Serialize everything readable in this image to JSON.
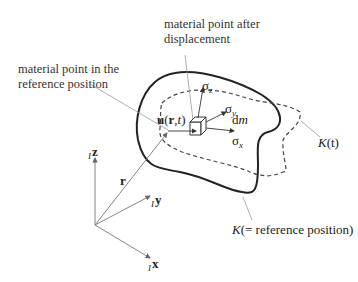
{
  "labels": {
    "after_displacement_line1": "material point after",
    "after_displacement_line2": "displacement",
    "reference_line1": "material point in the",
    "reference_line2": "reference position",
    "displacement": {
      "vec": "u",
      "open": "(",
      "r": "r",
      "comma": ",",
      "t": "t",
      "close": ")"
    },
    "sigma_z": {
      "sym": "σ",
      "sub": "z"
    },
    "sigma_y": {
      "sym": "σ",
      "sub": "y"
    },
    "sigma_x": {
      "sym": "σ",
      "sub": "x"
    },
    "dm": {
      "d": "d",
      "m": "m"
    },
    "K_t": {
      "K": "K",
      "rest": "(t)"
    },
    "K_ref": {
      "K": "K",
      "rest": "(= reference position)"
    },
    "r": "r",
    "axis_z": {
      "pre": "I",
      "name": "z"
    },
    "axis_y": {
      "pre": "I",
      "name": "y"
    },
    "axis_x": {
      "pre": "I",
      "name": "x"
    }
  },
  "colors": {
    "outline": "#222222",
    "leader": "#9a9a9a",
    "text": "#333333"
  }
}
